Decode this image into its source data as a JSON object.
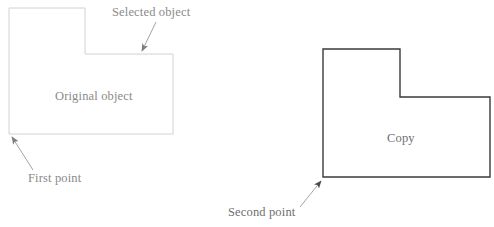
{
  "figure": {
    "background_color": "#ffffff"
  },
  "labels": {
    "selected_object": "Selected object",
    "original_object": "Original object",
    "first_point": "First point",
    "copy": "Copy",
    "second_point": "Second point"
  },
  "shapes": {
    "original": {
      "name": "Original object",
      "stroke_color": "#d2d2d2",
      "fill_color": "none",
      "stroke_width": 1,
      "points": "9,8 85,8 85,54 173,54 173,134 9,134"
    },
    "copy": {
      "name": "Copy",
      "stroke_color": "#3a3a3a",
      "fill_color": "none",
      "stroke_width": 1.4,
      "points": "323,49 400,49 400,97 490,97 490,177 323,177"
    }
  },
  "annotations": {
    "selected_object_arrow": {
      "name": "Selected object leader",
      "color": "#7d7d7d",
      "from": "156,22",
      "to": "141,53"
    },
    "first_point_arrow": {
      "name": "First point leader",
      "color": "#7d7d7d",
      "from": "33,170",
      "to": "10,135"
    },
    "second_point_arrow": {
      "name": "Second point leader",
      "color": "#7d7d7d",
      "from": "300,207",
      "to": "323,179"
    }
  },
  "point_markers": {
    "first_point": "9,134",
    "second_point": "323,177"
  }
}
